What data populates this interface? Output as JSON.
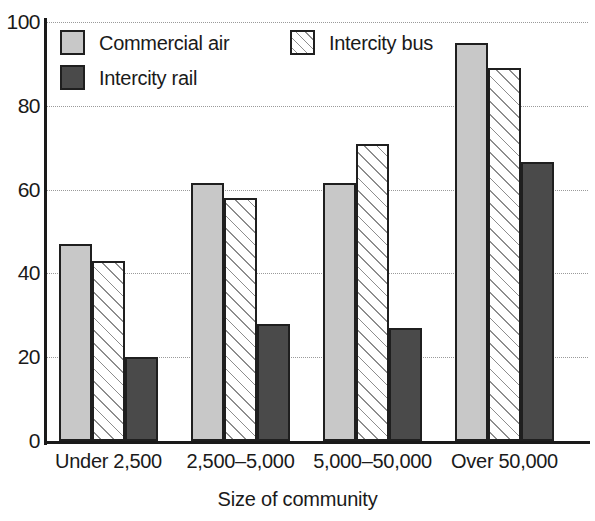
{
  "chart_data": {
    "type": "bar",
    "title": "",
    "xlabel": "Size of community",
    "ylabel": "",
    "ylim": [
      0,
      100
    ],
    "yticks": [
      0,
      20,
      40,
      60,
      80,
      100
    ],
    "grid": true,
    "legend_position": "top-left inside plot",
    "categories": [
      "Under 2,500",
      "2,500–5,000",
      "5,000–50,000",
      "Over 50,000"
    ],
    "series": [
      {
        "name": "Commercial air",
        "swatch": "air-swatch",
        "color": "#c8c8c8",
        "values": [
          47,
          61.5,
          61.5,
          95
        ]
      },
      {
        "name": "Intercity bus",
        "swatch": "bus-swatch",
        "color": "#ffffff",
        "values": [
          43,
          58,
          71,
          89
        ]
      },
      {
        "name": "Intercity rail",
        "swatch": "rail-swatch",
        "color": "#4a4a4a",
        "values": [
          20,
          28,
          27,
          66.5
        ]
      }
    ]
  },
  "axis": {
    "y_tick_labels": [
      "100",
      "80",
      "60",
      "40",
      "20",
      "0"
    ],
    "x_axis_title": "Size of community"
  },
  "legend": {
    "items": [
      {
        "label": "Commercial air",
        "icon": "air-swatch"
      },
      {
        "label": "Intercity bus",
        "icon": "bus-swatch"
      },
      {
        "label": "Intercity rail",
        "icon": "rail-swatch"
      }
    ]
  }
}
